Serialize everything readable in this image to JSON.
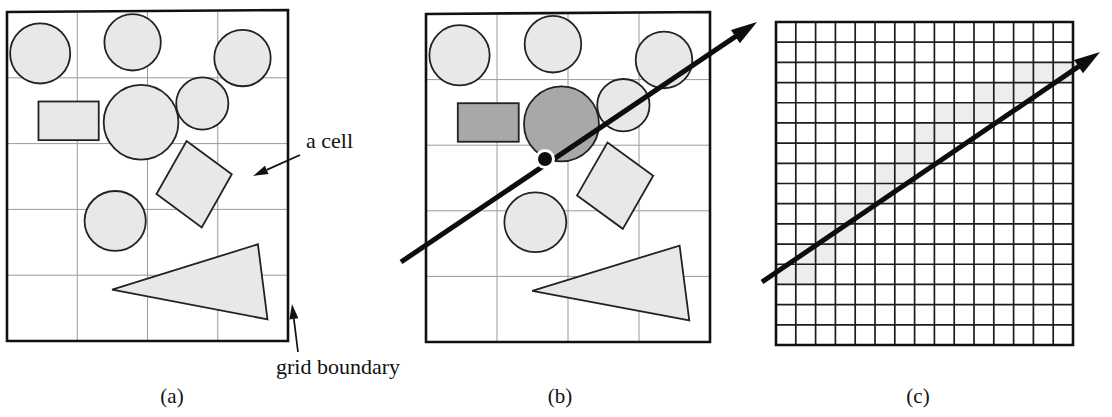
{
  "figure": {
    "kind": "diagram",
    "background_color": "#ffffff",
    "ink_color": "#111111"
  },
  "annotations": [
    {
      "id": "a-cell",
      "label": "a cell",
      "text_x": 306,
      "text_y": 148,
      "arrow_from_x": 300,
      "arrow_from_y": 155,
      "arrow_to_x": 253,
      "arrow_to_y": 176
    },
    {
      "id": "grid-boundary",
      "label": "grid boundary",
      "text_x": 276,
      "text_y": 374,
      "arrow_from_x": 298,
      "arrow_from_y": 352,
      "arrow_to_x": 292,
      "arrow_to_y": 304
    }
  ],
  "panels": [
    {
      "id": "a",
      "caption": "(a)",
      "caption_x": 172,
      "caption_y": 403,
      "box": {
        "x": 7,
        "y": 12,
        "w": 281,
        "h": 329
      },
      "grid": {
        "cols": 4,
        "rows": 5
      },
      "border_color": "#111111",
      "border_width": 2.6,
      "gridline_color": "#9a9a9a",
      "gridline_width": 1.0,
      "skew_top_right_dy": -2,
      "has_ray": false,
      "shape_fill": "#e8e8e8",
      "shape_stroke": "#222222"
    },
    {
      "id": "b",
      "caption": "(b)",
      "caption_x": 560,
      "caption_y": 403,
      "box": {
        "x": 426,
        "y": 14,
        "w": 284,
        "h": 328
      },
      "grid": {
        "cols": 4,
        "rows": 5
      },
      "border_color": "#111111",
      "border_width": 2.6,
      "gridline_color": "#9a9a9a",
      "gridline_width": 1.0,
      "skew_top_right_dy": -2,
      "has_ray": true,
      "shape_fill": "#e8e8e8",
      "shape_stroke": "#222222",
      "highlight_fill": "#a8a8a8",
      "ray": {
        "start_x": 401,
        "start_y": 262,
        "end_x": 757,
        "end_y": 22,
        "width": 5.0,
        "color": "#0d0d0d",
        "head_length": 26,
        "head_width": 16
      },
      "hit_point": {
        "x": 545,
        "y": 159,
        "radius": 7,
        "fill": "#0d0d0d",
        "halo_fill": "#ffffff",
        "halo_radius": 10
      },
      "highlighted_shape_ids": [
        "big-circle",
        "rect"
      ]
    },
    {
      "id": "c",
      "caption": "(c)",
      "caption_x": 918,
      "caption_y": 403,
      "box": {
        "x": 776,
        "y": 22,
        "w": 297,
        "h": 323
      },
      "grid": {
        "cols": 15,
        "rows": 16
      },
      "border_color": "#111111",
      "border_width": 2.6,
      "gridline_color": "#1d1d1d",
      "gridline_width": 1.7,
      "skew_top_right_dy": 0,
      "has_ray": true,
      "shaded_cell_fill": "#ededed",
      "ray": {
        "start_x": 762,
        "start_y": 282,
        "end_x": 1100,
        "end_y": 52,
        "width": 5.0,
        "color": "#0d0d0d",
        "head_length": 26,
        "head_width": 16
      },
      "shaded_cells": [
        [
          0,
          12
        ],
        [
          1,
          12
        ],
        [
          1,
          11
        ],
        [
          2,
          11
        ],
        [
          2,
          10
        ],
        [
          3,
          10
        ],
        [
          3,
          9
        ],
        [
          4,
          9
        ],
        [
          4,
          8
        ],
        [
          5,
          8
        ],
        [
          5,
          7
        ],
        [
          6,
          7
        ],
        [
          6,
          6
        ],
        [
          7,
          6
        ],
        [
          7,
          5
        ],
        [
          8,
          5
        ],
        [
          8,
          4
        ],
        [
          9,
          4
        ],
        [
          10,
          4
        ],
        [
          10,
          3
        ],
        [
          11,
          3
        ],
        [
          12,
          3
        ],
        [
          12,
          2
        ],
        [
          13,
          2
        ],
        [
          14,
          2
        ]
      ]
    }
  ],
  "scene_shapes": [
    {
      "id": "circle-tl",
      "type": "circle",
      "cx": 0.118,
      "cy": 0.126,
      "r": 0.0985
    },
    {
      "id": "circle-top",
      "type": "circle",
      "cx": 0.447,
      "cy": 0.092,
      "r": 0.0925
    },
    {
      "id": "circle-tr",
      "type": "circle",
      "cx": 0.838,
      "cy": 0.14,
      "r": 0.0925
    },
    {
      "id": "circle-r",
      "type": "circle",
      "cx": 0.695,
      "cy": 0.278,
      "r": 0.0855
    },
    {
      "id": "big-circle",
      "type": "circle",
      "cx": 0.477,
      "cy": 0.335,
      "r": 0.1225
    },
    {
      "id": "ellipse-low",
      "type": "ellipse",
      "cx": 0.385,
      "cy": 0.635,
      "rx": 0.109,
      "ry": 0.091
    },
    {
      "id": "rect",
      "type": "rect",
      "x": 0.112,
      "y": 0.272,
      "w": 0.2145,
      "h": 0.1175
    },
    {
      "id": "diamond",
      "type": "polygon",
      "points": "0.639,0.392 0.800,0.493 0.693,0.655 0.532,0.553"
    },
    {
      "id": "triangle",
      "type": "polygon",
      "points": "0.893,0.706 0.927,0.934 0.374,0.844"
    }
  ]
}
